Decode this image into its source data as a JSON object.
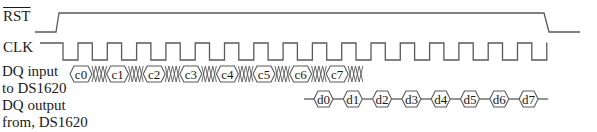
{
  "signals": {
    "rst": {
      "label": "RST",
      "overline": true
    },
    "clk": {
      "label": "CLK"
    },
    "dq_in": {
      "label_line1": "DQ input",
      "label_line2": "to DS1620"
    },
    "dq_out": {
      "label_line1": "DQ output",
      "label_line2": "from, DS1620"
    }
  },
  "input_bits": [
    "c0",
    "c1",
    "c2",
    "c3",
    "c4",
    "c5",
    "c6",
    "c7"
  ],
  "output_bits": [
    "d0",
    "d1",
    "d2",
    "d3",
    "d4",
    "d5",
    "d6",
    "d7"
  ],
  "colors": {
    "wave": "#5a5a5a",
    "text": "#1a1a1a",
    "background": "#ffffff"
  },
  "waveform": {
    "rst": {
      "low_y": 32,
      "high_y": 13,
      "start_x": 35,
      "rise_x0": 56,
      "rise_x1": 59,
      "fall_x0": 544,
      "fall_x1": 549,
      "end_x": 580
    },
    "clk": {
      "high_y": 43,
      "low_y": 60,
      "start_x": 40,
      "first_fall_x": 63,
      "period": 29.3,
      "low_width": 15,
      "cycles": 18,
      "end_x": 547
    },
    "dq_in": {
      "y_center": 74,
      "half_height": 8,
      "start_x": 70,
      "box_width": 22,
      "xzone_width": 14.6
    },
    "dq_out": {
      "y_center": 99,
      "half_height": 8,
      "start_x": 304,
      "first_box_x": 314,
      "box_width": 19,
      "gap": 10.3,
      "end_tail": 10
    }
  }
}
